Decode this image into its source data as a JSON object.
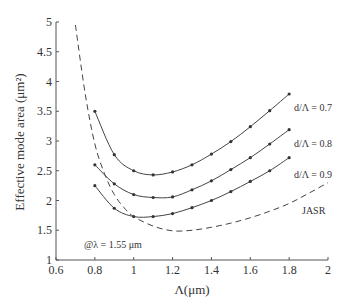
{
  "chart_data": {
    "type": "line",
    "title": "",
    "xlabel": "Λ(μm)",
    "ylabel": "Effective mode area (μm²)",
    "xlim": [
      0.6,
      2.0
    ],
    "ylim": [
      1,
      5
    ],
    "xticks": [
      0.6,
      0.8,
      1,
      1.2,
      1.4,
      1.6,
      1.8,
      2
    ],
    "xtick_labels": [
      "0.6",
      "0.8",
      "1",
      "1.2",
      "1.4",
      "1.6",
      "1.8",
      "2"
    ],
    "yticks": [
      1,
      1.5,
      2,
      2.5,
      3,
      3.5,
      4,
      4.5,
      5
    ],
    "ytick_labels": [
      "1",
      "1.5",
      "2",
      "2.5",
      "3",
      "3.5",
      "4",
      "4.5",
      "5"
    ],
    "grid": false,
    "annotation": "@λ = 1.55 μm",
    "series": [
      {
        "name": "d/Λ = 0.7",
        "style": "solid-markers",
        "x": [
          0.8,
          0.9,
          1.0,
          1.1,
          1.2,
          1.3,
          1.4,
          1.5,
          1.6,
          1.7,
          1.8
        ],
        "values": [
          3.5,
          2.77,
          2.5,
          2.43,
          2.48,
          2.6,
          2.78,
          2.99,
          3.24,
          3.51,
          3.79
        ]
      },
      {
        "name": "d/Λ = 0.8",
        "style": "solid-markers",
        "x": [
          0.8,
          0.9,
          1.0,
          1.1,
          1.2,
          1.3,
          1.4,
          1.5,
          1.6,
          1.7,
          1.8
        ],
        "values": [
          2.6,
          2.28,
          2.1,
          2.05,
          2.06,
          2.18,
          2.33,
          2.52,
          2.72,
          2.95,
          3.19
        ]
      },
      {
        "name": "d/Λ = 0.9",
        "style": "solid-markers",
        "x": [
          0.8,
          0.9,
          1.0,
          1.1,
          1.2,
          1.3,
          1.4,
          1.5,
          1.6,
          1.7,
          1.8
        ],
        "values": [
          2.25,
          1.87,
          1.73,
          1.73,
          1.78,
          1.88,
          2.0,
          2.15,
          2.32,
          2.5,
          2.72
        ]
      },
      {
        "name": "JASR",
        "style": "dashed",
        "x": [
          0.7,
          0.75,
          0.8,
          0.85,
          0.9,
          0.95,
          1.0,
          1.1,
          1.2,
          1.3,
          1.4,
          1.5,
          1.6,
          1.7,
          1.8,
          1.9,
          2.0
        ],
        "values": [
          4.95,
          3.8,
          2.95,
          2.45,
          2.1,
          1.88,
          1.73,
          1.57,
          1.49,
          1.5,
          1.55,
          1.62,
          1.71,
          1.82,
          1.95,
          2.12,
          2.3
        ]
      }
    ],
    "legend_labels": [
      {
        "text": "d/Λ = 0.7",
        "series": 0
      },
      {
        "text": "d/Λ = 0.8",
        "series": 1
      },
      {
        "text": "d/Λ = 0.9",
        "series": 2
      },
      {
        "text": "JASR",
        "series": 3
      }
    ]
  }
}
